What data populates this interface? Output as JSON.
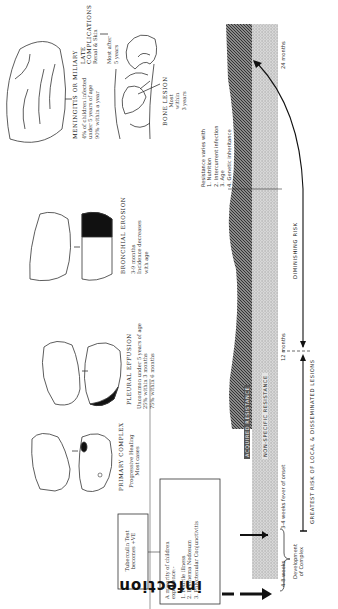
{
  "diagram": {
    "infection_label": "infection",
    "tuberculin_box": "Tuberculin Test\nbecomes +VE",
    "minority_box": {
      "heading": "A minority of children\nexperience:-",
      "items": [
        "1.  Febrile illness",
        "2.  Erythema Nodosum",
        "3.  Phlyctenular Conjunctivitis"
      ]
    },
    "stages": [
      {
        "id": "primary-complex",
        "title": "PRIMARY COMPLEX",
        "notes": [
          "Progressive Healing",
          "Most cases"
        ]
      },
      {
        "id": "pleural-effusion",
        "title": "PLEURAL EFFUSION",
        "notes": [
          "Uncommon under 5 years of age",
          "25% within 3 months",
          "75% within 6 months"
        ]
      },
      {
        "id": "bronchial-erosion",
        "title": "BRONCHIAL EROSION",
        "notes": [
          "3-9 months",
          "Incidence decreases",
          "with age"
        ]
      },
      {
        "id": "meningitis",
        "title": "MENINGITIS OR MILIARY",
        "notes": [
          "4% of children infected",
          "under 5 years of age",
          "90% within a year"
        ]
      },
      {
        "id": "bone-lesion",
        "title": "BONE LESION",
        "notes": [
          "Most",
          "within",
          "3 years"
        ]
      },
      {
        "id": "late-complications",
        "title": "LATE\nCOMPLICATIONS",
        "subtitle": "Renal  &  Skin",
        "notes": [
          "Most after",
          "5 years"
        ]
      }
    ],
    "resistance": {
      "acquired_label": "ACQUIRED RESISTANCE",
      "nonspecific_label": "NON-SPECIFIC RESISTANCE",
      "varies_heading": "Resistance varies with",
      "factors": [
        "1.  Nutrition",
        "2.  Intercurrent infection",
        "3.  Age",
        "4.  Genetic inheritance"
      ]
    },
    "timeline": {
      "markers": [
        "4-8 weeks",
        "3-4 weeks fever of onset",
        "12 months",
        "24 months"
      ],
      "development_label": "Development\nof Complex"
    },
    "risk": {
      "greatest": "GREATEST RISK OF LOCAL & DISSEMINATED LESIONS",
      "diminishing": "DIMINISHING RISK"
    }
  }
}
